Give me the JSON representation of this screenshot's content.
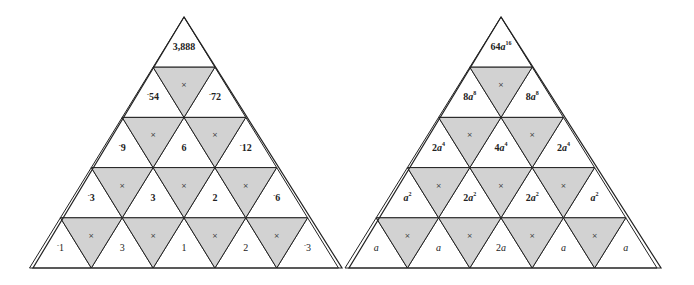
{
  "colors": {
    "stroke": "#222222",
    "shaded": "#d2d2d2",
    "white": "#ffffff"
  },
  "operator_symbol": "×",
  "pyramids": [
    {
      "name": "numeric-pyramid",
      "apex": [
        184,
        17
      ],
      "base_left": [
        33,
        268
      ],
      "base_right": [
        342,
        268
      ],
      "rows": [
        [
          {
            "text": "3,888",
            "bold": true
          }
        ],
        [
          {
            "neg": true,
            "text": "54",
            "bold": true
          },
          {
            "neg": true,
            "text": "72",
            "bold": true
          }
        ],
        [
          {
            "neg": true,
            "text": "9",
            "bold": true
          },
          {
            "text": "6",
            "bold": true
          },
          {
            "neg": true,
            "text": "12",
            "bold": true
          }
        ],
        [
          {
            "neg": true,
            "text": "3",
            "bold": true
          },
          {
            "text": "3",
            "bold": true
          },
          {
            "text": "2",
            "bold": true
          },
          {
            "neg": true,
            "text": "6",
            "bold": true
          }
        ],
        [
          {
            "neg": true,
            "text": "1",
            "bold": false
          },
          {
            "text": "3",
            "bold": false
          },
          {
            "text": "1",
            "bold": false
          },
          {
            "text": "2",
            "bold": false
          },
          {
            "neg": true,
            "text": "3",
            "bold": false
          }
        ]
      ]
    },
    {
      "name": "algebraic-pyramid",
      "apex": [
        501,
        17
      ],
      "base_left": [
        349,
        268
      ],
      "base_right": [
        661,
        268
      ],
      "rows": [
        [
          {
            "coef": "64",
            "var": "a",
            "exp": "16",
            "bold": true
          }
        ],
        [
          {
            "coef": "8",
            "var": "a",
            "exp": "8",
            "bold": true
          },
          {
            "coef": "8",
            "var": "a",
            "exp": "8",
            "bold": true
          }
        ],
        [
          {
            "coef": "2",
            "var": "a",
            "exp": "4",
            "bold": true
          },
          {
            "coef": "4",
            "var": "a",
            "exp": "4",
            "bold": true
          },
          {
            "coef": "2",
            "var": "a",
            "exp": "4",
            "bold": true
          }
        ],
        [
          {
            "coef": "",
            "var": "a",
            "exp": "2",
            "bold": true
          },
          {
            "coef": "2",
            "var": "a",
            "exp": "2",
            "bold": true
          },
          {
            "coef": "2",
            "var": "a",
            "exp": "2",
            "bold": true
          },
          {
            "coef": "",
            "var": "a",
            "exp": "2",
            "bold": true
          }
        ],
        [
          {
            "coef": "",
            "var": "a",
            "exp": "",
            "bold": false
          },
          {
            "coef": "",
            "var": "a",
            "exp": "",
            "bold": false
          },
          {
            "coef": "2",
            "var": "a",
            "exp": "",
            "bold": false
          },
          {
            "coef": "",
            "var": "a",
            "exp": "",
            "bold": false
          },
          {
            "coef": "",
            "var": "a",
            "exp": "",
            "bold": false
          }
        ]
      ]
    }
  ]
}
